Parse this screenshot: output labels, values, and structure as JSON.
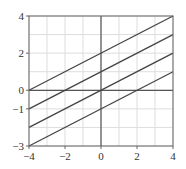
{
  "chart_data": {
    "type": "line",
    "title": "",
    "xlabel": "",
    "ylabel": "",
    "xlim": [
      -4,
      4
    ],
    "ylim": [
      -3,
      4
    ],
    "grid": true,
    "grid_step": {
      "x": 1,
      "y": 1
    },
    "x_ticks": [
      -4,
      -2,
      0,
      2,
      4
    ],
    "x_tick_labels": [
      "−4",
      "−2",
      "0",
      "2",
      "4"
    ],
    "y_ticks": [
      4,
      2,
      0,
      -1,
      -3
    ],
    "y_tick_labels": [
      "4",
      "2",
      "0",
      "−1",
      "−3"
    ],
    "x": [
      -4,
      4
    ],
    "series": [
      {
        "name": "y = 0.5x + 2",
        "slope": 0.5,
        "intercept": 2,
        "values": [
          0,
          4
        ]
      },
      {
        "name": "y = 0.5x + 1",
        "slope": 0.5,
        "intercept": 1,
        "values": [
          -1,
          3
        ]
      },
      {
        "name": "y = 0.5x",
        "slope": 0.5,
        "intercept": 0,
        "values": [
          -2,
          2
        ]
      },
      {
        "name": "y = 0.5x − 1",
        "slope": 0.5,
        "intercept": -1,
        "values": [
          -3,
          1
        ]
      }
    ],
    "legend": null
  },
  "colors": {
    "line": "#444444",
    "axis": "#555555",
    "grid": "#dddddd",
    "frame": "#666666",
    "text": "#333333"
  }
}
